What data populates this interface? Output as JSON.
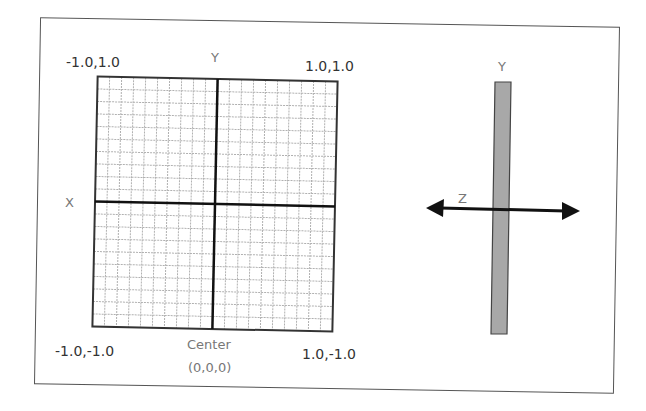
{
  "diagram": {
    "colors": {
      "frame": "#555555",
      "grid_line": "#b0b0b0",
      "grid_border": "#333333",
      "axis": "#111111",
      "label_dark": "#333333",
      "label_gray": "#777777",
      "bar_fill": "#a8a8a8",
      "bar_stroke": "#444444",
      "arrow": "#111111"
    },
    "front_view": {
      "grid_cells_per_side": 20,
      "corner_labels": {
        "top_left": "-1.0,1.0",
        "top_right": "1.0,1.0",
        "bottom_left": "-1.0,-1.0",
        "bottom_right": "1.0,-1.0"
      },
      "axis_labels": {
        "y": "Y",
        "x": "X"
      },
      "center_label": {
        "line1": "Center",
        "line2": "(0,0,0)"
      }
    },
    "side_view": {
      "axis_labels": {
        "y": "Y",
        "z": "Z"
      },
      "bar": {
        "description": "Plane seen edge-on along Y axis"
      },
      "arrow": {
        "description": "Double-headed Z axis arrow"
      }
    }
  }
}
